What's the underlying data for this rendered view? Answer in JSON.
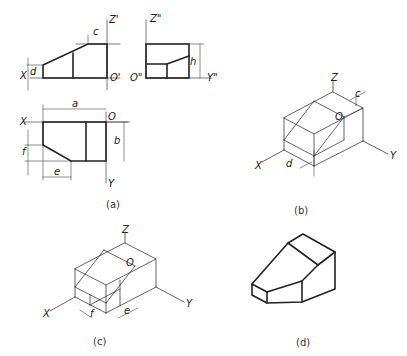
{
  "figure": {
    "panels": [
      {
        "id": "a",
        "caption": "(a)",
        "description": "Three-view orthographic projection with dimensions a, b, c, d, e, f, h"
      },
      {
        "id": "b",
        "caption": "(b)",
        "description": "Isometric box showing cut from front view (c, d)"
      },
      {
        "id": "c",
        "caption": "(c)",
        "description": "Isometric box showing cut from top view (e, f)"
      },
      {
        "id": "d",
        "caption": "(d)",
        "description": "Finished isometric solid"
      }
    ],
    "labels": {
      "front_z": "Z'",
      "front_x": "X",
      "front_o": "O'",
      "dim_c": "c",
      "dim_d": "d",
      "side_z": "Z\"",
      "side_o": "O\"",
      "side_y": "Y\"",
      "dim_h": "h",
      "top_x": "X",
      "top_o": "O",
      "top_y": "Y",
      "dim_a": "a",
      "dim_b": "b",
      "dim_e": "e",
      "dim_f": "f",
      "b_z": "Z",
      "b_o": "O",
      "b_x": "X",
      "b_y": "Y",
      "b_c": "c",
      "b_d": "d",
      "c_z": "Z",
      "c_o": "O",
      "c_x": "X",
      "c_y": "Y",
      "c_e": "e",
      "c_f": "f"
    }
  }
}
